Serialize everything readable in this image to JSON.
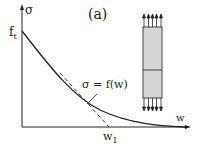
{
  "diagram": {
    "panel_label": "(a)",
    "y_axis_label": "σ",
    "x_axis_label": "w",
    "y_tick_label": "f",
    "y_tick_sub": "t",
    "x_tick_label": "w",
    "x_tick_sub": "1",
    "curve_label": "σ = f(w)",
    "colors": {
      "line": "#222222",
      "specimen_fill": "#d6d6d6"
    }
  }
}
